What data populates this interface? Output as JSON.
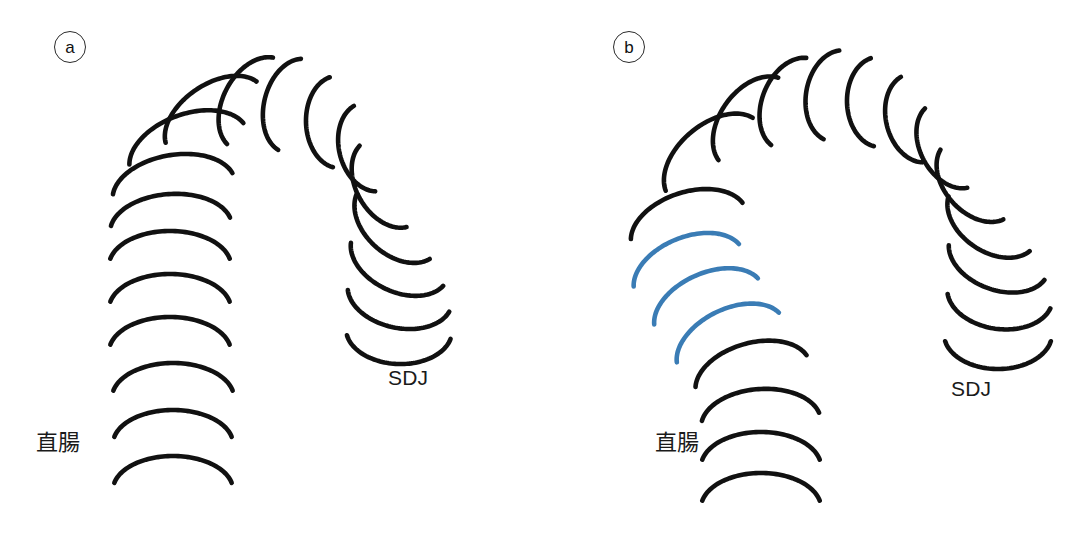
{
  "figure": {
    "width": 1082,
    "height": 553,
    "background": "#ffffff",
    "stroke_color_default": "#111111",
    "stroke_color_highlight": "#3a7cb5",
    "stroke_width": 4.6
  },
  "panels": [
    {
      "id": "a",
      "badge_label": "a",
      "description": "Normal sigmoid-rectum haustral fold chain forming an inverted-U loop",
      "labels": [
        {
          "name": "rectum-label",
          "text": "直腸",
          "x": 36,
          "y": 424,
          "lang": "ja"
        },
        {
          "name": "sdj-label",
          "text": "SDJ",
          "x": 388,
          "y": 366,
          "lang": "en"
        }
      ],
      "arc_geometry_note": "Each arc is an open ring ~205 degrees, rx/ry per arc, rotated along the loop path",
      "arcs": [
        {
          "cx": 215,
          "cy": 118,
          "rx": 56,
          "ry": 34,
          "rot": -34,
          "color": "default"
        },
        {
          "cx": 256,
          "cy": 104,
          "rx": 50,
          "ry": 33,
          "rot": -62,
          "color": "default"
        },
        {
          "cx": 296,
          "cy": 106,
          "rx": 48,
          "ry": 32,
          "rot": -76,
          "color": "default"
        },
        {
          "cx": 338,
          "cy": 122,
          "rx": 46,
          "ry": 32,
          "rot": -92,
          "color": "default"
        },
        {
          "cx": 371,
          "cy": 147,
          "rx": 45,
          "ry": 32,
          "rot": -104,
          "color": "default"
        },
        {
          "cx": 189,
          "cy": 151,
          "rx": 62,
          "ry": 37,
          "rot": -20,
          "color": "default"
        },
        {
          "cx": 174,
          "cy": 191,
          "rx": 62,
          "ry": 36,
          "rot": -10,
          "color": "default"
        },
        {
          "cx": 171,
          "cy": 229,
          "rx": 61,
          "ry": 35,
          "rot": -4,
          "color": "default"
        },
        {
          "cx": 170,
          "cy": 266,
          "rx": 61,
          "ry": 35,
          "rot": 0,
          "color": "default"
        },
        {
          "cx": 170,
          "cy": 309,
          "rx": 61,
          "ry": 35,
          "rot": 0,
          "color": "default"
        },
        {
          "cx": 170,
          "cy": 352,
          "rx": 61,
          "ry": 35,
          "rot": 0,
          "color": "default"
        },
        {
          "cx": 173,
          "cy": 398,
          "rx": 61,
          "ry": 35,
          "rot": 0,
          "color": "default"
        },
        {
          "cx": 173,
          "cy": 444,
          "rx": 60,
          "ry": 34,
          "rot": 0,
          "color": "default"
        },
        {
          "cx": 173,
          "cy": 490,
          "rx": 60,
          "ry": 34,
          "rot": 0,
          "color": "default"
        },
        {
          "cx": 389,
          "cy": 183,
          "rx": 48,
          "ry": 33,
          "rot": -120,
          "color": "default"
        },
        {
          "cx": 398,
          "cy": 221,
          "rx": 50,
          "ry": 34,
          "rot": -138,
          "color": "default"
        },
        {
          "cx": 400,
          "cy": 258,
          "rx": 52,
          "ry": 34,
          "rot": -155,
          "color": "default"
        },
        {
          "cx": 400,
          "cy": 294,
          "rx": 53,
          "ry": 34,
          "rot": -168,
          "color": "default"
        },
        {
          "cx": 399,
          "cy": 330,
          "rx": 53,
          "ry": 34,
          "rot": -178,
          "color": "default"
        }
      ]
    },
    {
      "id": "b",
      "badge_label": "b",
      "description": "Sigmoid-rectum chain with three proximal folds highlighted in blue (redundant segment)",
      "labels": [
        {
          "name": "rectum-label",
          "text": "直腸",
          "x": 114,
          "y": 424,
          "lang": "ja"
        },
        {
          "name": "sdj-label",
          "text": "SDJ",
          "x": 410,
          "y": 377,
          "lang": "en"
        }
      ],
      "arcs": [
        {
          "cx": 173,
          "cy": 160,
          "rx": 58,
          "ry": 36,
          "rot": -40,
          "color": "default"
        },
        {
          "cx": 213,
          "cy": 123,
          "rx": 52,
          "ry": 34,
          "rot": -54,
          "color": "default"
        },
        {
          "cx": 254,
          "cy": 104,
          "rx": 48,
          "ry": 33,
          "rot": -68,
          "color": "default"
        },
        {
          "cx": 297,
          "cy": 96,
          "rx": 46,
          "ry": 32,
          "rot": -80,
          "color": "default"
        },
        {
          "cx": 338,
          "cy": 102,
          "rx": 45,
          "ry": 32,
          "rot": -92,
          "color": "default"
        },
        {
          "cx": 377,
          "cy": 118,
          "rx": 45,
          "ry": 32,
          "rot": -104,
          "color": "default"
        },
        {
          "cx": 411,
          "cy": 145,
          "rx": 46,
          "ry": 32,
          "rot": -118,
          "color": "default"
        },
        {
          "cx": 436,
          "cy": 180,
          "rx": 48,
          "ry": 33,
          "rot": -132,
          "color": "default"
        },
        {
          "cx": 452,
          "cy": 218,
          "rx": 50,
          "ry": 34,
          "rot": -146,
          "color": "default"
        },
        {
          "cx": 458,
          "cy": 256,
          "rx": 52,
          "ry": 34,
          "rot": -160,
          "color": "default"
        },
        {
          "cx": 459,
          "cy": 294,
          "rx": 53,
          "ry": 35,
          "rot": -172,
          "color": "default"
        },
        {
          "cx": 457,
          "cy": 334,
          "rx": 54,
          "ry": 35,
          "rot": -180,
          "color": "default"
        },
        {
          "cx": 148,
          "cy": 228,
          "rx": 60,
          "ry": 36,
          "rot": -18,
          "color": "default"
        },
        {
          "cx": 148,
          "cy": 272,
          "rx": 58,
          "ry": 35,
          "rot": -22,
          "color": "highlight"
        },
        {
          "cx": 168,
          "cy": 308,
          "rx": 58,
          "ry": 35,
          "rot": -24,
          "color": "highlight"
        },
        {
          "cx": 190,
          "cy": 344,
          "rx": 58,
          "ry": 35,
          "rot": -26,
          "color": "highlight"
        },
        {
          "cx": 212,
          "cy": 378,
          "rx": 59,
          "ry": 35,
          "rot": -16,
          "color": "default"
        },
        {
          "cx": 220,
          "cy": 424,
          "rx": 60,
          "ry": 35,
          "rot": -4,
          "color": "default"
        },
        {
          "cx": 220,
          "cy": 467,
          "rx": 60,
          "ry": 35,
          "rot": 0,
          "color": "default"
        },
        {
          "cx": 220,
          "cy": 508,
          "rx": 60,
          "ry": 35,
          "rot": 0,
          "color": "default"
        }
      ]
    }
  ]
}
